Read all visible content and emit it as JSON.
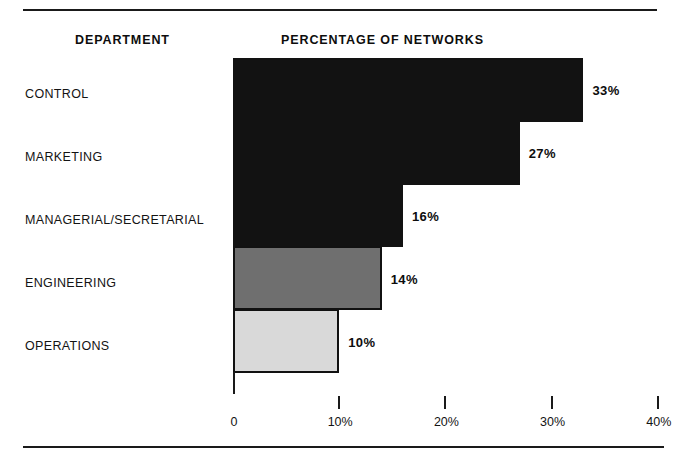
{
  "figure": {
    "column_headers": {
      "department": "DEPARTMENT",
      "percentage": "PERCENTAGE OF NETWORKS"
    }
  },
  "chart_data": {
    "type": "bar",
    "orientation": "horizontal",
    "title": "PERCENTAGE OF NETWORKS",
    "xlabel": "",
    "ylabel": "DEPARTMENT",
    "categories": [
      "CONTROL",
      "MARKETING",
      "MANAGERIAL/SECRETARIAL",
      "ENGINEERING",
      "OPERATIONS"
    ],
    "values": [
      33,
      27,
      16,
      14,
      10
    ],
    "value_labels": [
      "33%",
      "27%",
      "16%",
      "14%",
      "10%"
    ],
    "bar_colors": [
      "#121212",
      "#121212",
      "#121212",
      "#6f6f6f",
      "#d9d9d9"
    ],
    "xlim": [
      0,
      40
    ],
    "xticks": [
      0,
      10,
      20,
      30,
      40
    ],
    "xtick_labels": [
      "0",
      "10%",
      "20%",
      "30%",
      "40%"
    ],
    "grid": false,
    "legend": "none"
  }
}
